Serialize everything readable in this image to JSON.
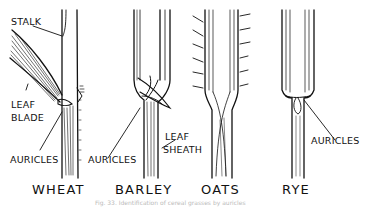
{
  "figure": {
    "caption": "Fig. 33. Identification of cereal grasses by auricles",
    "labels": {
      "stalk": "STALK",
      "leaf_blade_1": "LEAF",
      "leaf_blade_2": "BLADE",
      "auricles_wheat": "AURICLES",
      "auricles_barley": "AURICLES",
      "leaf_sheath_1": "LEAF",
      "leaf_sheath_2": "SHEATH",
      "auricles_rye": "AURICLES"
    },
    "plants": [
      {
        "name": "WHEAT"
      },
      {
        "name": "BARLEY"
      },
      {
        "name": "OATS"
      },
      {
        "name": "RYE"
      }
    ],
    "colors": {
      "ink": "#111111",
      "paper": "#ffffff"
    }
  }
}
